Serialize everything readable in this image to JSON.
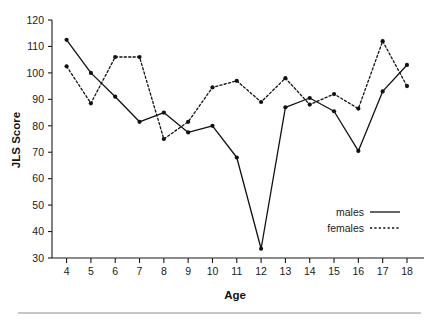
{
  "chart_data": {
    "type": "line",
    "title": "",
    "xlabel": "Age",
    "ylabel": "JLS Score",
    "x": [
      4,
      5,
      6,
      7,
      8,
      9,
      10,
      11,
      12,
      13,
      14,
      15,
      16,
      17,
      18
    ],
    "xtick_labels": [
      "4",
      "5",
      "6",
      "7",
      "8",
      "9",
      "10",
      "11",
      "12",
      "13",
      "14",
      "15",
      "16",
      "17",
      "18"
    ],
    "ytick_labels": [
      "30",
      "40",
      "50",
      "60",
      "70",
      "80",
      "90",
      "100",
      "110",
      "120"
    ],
    "yticks": [
      30,
      40,
      50,
      60,
      70,
      80,
      90,
      100,
      110,
      120
    ],
    "xlim": [
      3.4,
      18.7
    ],
    "ylim": [
      30,
      120
    ],
    "grid": false,
    "legend_position": "lower-right",
    "series": [
      {
        "name": "males",
        "style": "solid",
        "marker": "circle",
        "values": [
          112.5,
          100,
          91,
          81.5,
          85,
          77.5,
          80,
          68,
          33.5,
          87,
          90.5,
          85.5,
          70.5,
          93,
          103
        ]
      },
      {
        "name": "females",
        "style": "dotted",
        "marker": "circle",
        "values": [
          102.5,
          88.5,
          106,
          106,
          75,
          81.5,
          94.5,
          97,
          89,
          98,
          88,
          92,
          86.5,
          112,
          95
        ]
      }
    ]
  },
  "legend": {
    "entries": [
      {
        "label": "males",
        "style": "solid"
      },
      {
        "label": "females",
        "style": "dotted"
      }
    ]
  },
  "colors": {
    "ink": "#111111",
    "axis": "#1a1a1a",
    "footer_rule": "#b6b6b6",
    "background": "#ffffff"
  }
}
